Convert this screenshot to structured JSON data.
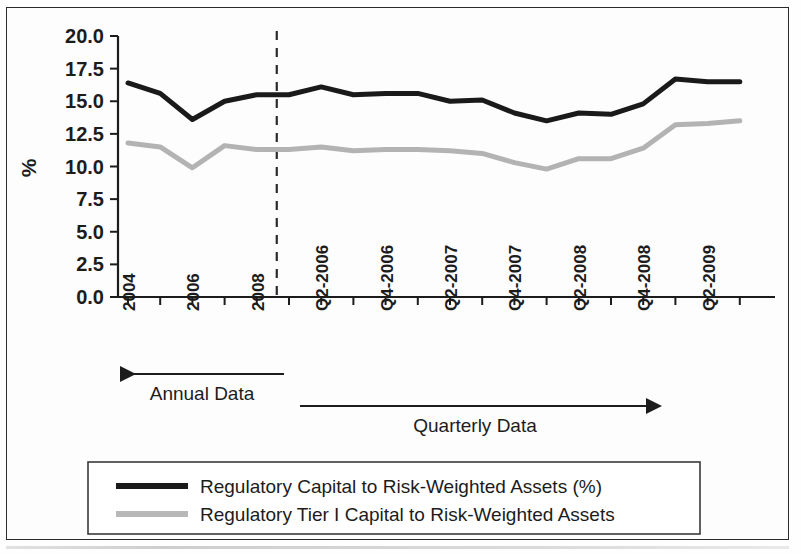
{
  "chart_data": {
    "type": "line",
    "title": "",
    "xlabel": "",
    "ylabel": "%",
    "ylim": [
      0.0,
      20.0
    ],
    "ytick_values": [
      0.0,
      2.5,
      5.0,
      7.5,
      10.0,
      12.5,
      15.0,
      17.5,
      20.0
    ],
    "ytick_labels": [
      "0.0",
      "2.5",
      "5.0",
      "7.5",
      "10.0",
      "12.5",
      "15.0",
      "17.5",
      "20.0"
    ],
    "grid": false,
    "legend_position": "bottom",
    "x_categories": [
      "2004",
      "2005",
      "2006",
      "2007",
      "2008",
      "Q1-2006",
      "Q2-2006",
      "Q3-2006",
      "Q4-2006",
      "Q1-2007",
      "Q2-2007",
      "Q3-2007",
      "Q4-2007",
      "Q1-2008",
      "Q2-2008",
      "Q3-2008",
      "Q4-2008",
      "Q1-2009",
      "Q2-2009",
      "Q3-2009"
    ],
    "xtick_labels_shown": [
      "2004",
      "2006",
      "2008",
      "Q2-2006",
      "Q4-2006",
      "Q2-2007",
      "Q4-2007",
      "Q2-2008",
      "Q4-2008",
      "Q2-2009"
    ],
    "divider": {
      "label": "annual-quarterly-split",
      "after_category": "2008",
      "style": "dashed"
    },
    "bands": [
      {
        "label": "Annual Data",
        "direction": "left",
        "from_category": "2008",
        "to_category": "2004"
      },
      {
        "label": "Quarterly Data",
        "direction": "right",
        "from_category": "Q1-2006",
        "to_category": "Q2-2009"
      }
    ],
    "series": [
      {
        "name": "Regulatory Capital to Risk-Weighted Assets (%)",
        "color": "#1a1a1a",
        "width": 5,
        "values": [
          16.4,
          15.6,
          13.6,
          15.0,
          15.5,
          15.5,
          16.1,
          15.5,
          15.6,
          15.6,
          15.0,
          15.1,
          14.1,
          13.5,
          14.1,
          14.0,
          14.8,
          16.7,
          16.5,
          16.5
        ]
      },
      {
        "name": "Regulatory Tier I Capital to Risk-Weighted Assets",
        "color": "#b3b3b3",
        "width": 5,
        "values": [
          11.8,
          11.5,
          9.9,
          11.6,
          11.3,
          11.3,
          11.5,
          11.2,
          11.3,
          11.3,
          11.2,
          11.0,
          10.3,
          9.8,
          10.6,
          10.6,
          11.4,
          13.2,
          13.3,
          13.5
        ]
      }
    ]
  },
  "axis": {
    "y_title": "%"
  },
  "legend": {
    "entries": [
      {
        "label": "Regulatory Capital to Risk-Weighted Assets (%)",
        "color": "#1a1a1a"
      },
      {
        "label": "Regulatory Tier I Capital to Risk-Weighted Assets",
        "color": "#b8b8b8"
      }
    ]
  }
}
